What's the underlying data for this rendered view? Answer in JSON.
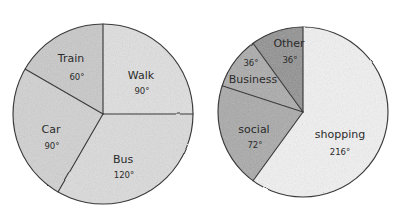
{
  "chart_data": [
    {
      "type": "pie",
      "title": "Travel to school",
      "name": "transport-pie",
      "center": [
        103,
        114
      ],
      "radius": 90,
      "start_angle_deg": 0,
      "direction": "clockwise",
      "unit": "degrees",
      "total_degrees": 360,
      "legend": "none",
      "grid": false,
      "categories": [
        "Walk",
        "Bus",
        "Car",
        "Train"
      ],
      "values": [
        90,
        120,
        90,
        60
      ],
      "slices": [
        {
          "label": "Walk",
          "value": 90,
          "value_label": "90°",
          "color": "#e0e0e0",
          "start_deg": 0,
          "end_deg": 90,
          "label_x": 141,
          "label_y": 76,
          "deg_x": 142,
          "deg_y": 91
        },
        {
          "label": "Bus",
          "value": 120,
          "value_label": "120°",
          "color": "#dcdcdc",
          "start_deg": 90,
          "end_deg": 210,
          "label_x": 123,
          "label_y": 160,
          "deg_x": 124,
          "deg_y": 175
        },
        {
          "label": "Car",
          "value": 90,
          "value_label": "90°",
          "color": "#d2d2d2",
          "start_deg": 210,
          "end_deg": 300,
          "label_x": 51,
          "label_y": 130,
          "deg_x": 52,
          "deg_y": 146
        },
        {
          "label": "Train",
          "value": 60,
          "value_label": "60°",
          "color": "#c9c9c9",
          "start_deg": 300,
          "end_deg": 360,
          "label_x": 71,
          "label_y": 59,
          "deg_x": 77,
          "deg_y": 77
        }
      ]
    },
    {
      "type": "pie",
      "title": "Reasons for internet use",
      "name": "internet-use-pie",
      "center": [
        303,
        112
      ],
      "radius": 85,
      "start_angle_deg": 0,
      "direction": "clockwise",
      "unit": "degrees",
      "total_degrees": 360,
      "legend": "none",
      "grid": false,
      "categories": [
        "shopping",
        "social",
        "Business",
        "Other"
      ],
      "values": [
        216,
        72,
        36,
        36
      ],
      "slices": [
        {
          "label": "shopping",
          "value": 216,
          "value_label": "216°",
          "color": "#f2f2f2",
          "start_deg": 0,
          "end_deg": 216,
          "label_x": 340,
          "label_y": 135,
          "deg_x": 340,
          "deg_y": 152
        },
        {
          "label": "social",
          "value": 72,
          "value_label": "72°",
          "color": "#a9a9a9",
          "start_deg": 216,
          "end_deg": 288,
          "label_x": 254,
          "label_y": 130,
          "deg_x": 255,
          "deg_y": 145
        },
        {
          "label": "Business",
          "value": 36,
          "value_label": "36°",
          "color": "#aaaaaa",
          "start_deg": 288,
          "end_deg": 324,
          "label_x": 253,
          "label_y": 80,
          "deg_x": 251,
          "deg_y": 63
        },
        {
          "label": "Other",
          "value": 36,
          "value_label": "36°",
          "color": "#909090",
          "start_deg": 324,
          "end_deg": 360,
          "label_x": 289,
          "label_y": 44,
          "deg_x": 290,
          "deg_y": 60
        }
      ]
    }
  ]
}
